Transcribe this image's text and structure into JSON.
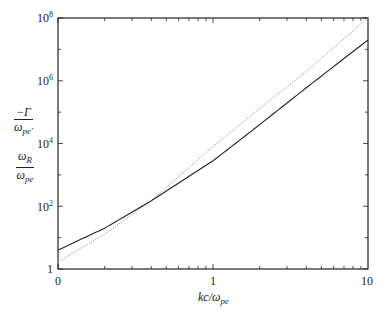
{
  "chart_data": {
    "type": "line",
    "title": "",
    "xlabel": "kc/ω_pe",
    "ylabel": [
      "-Γ/ω_pe'",
      "ω_R/ω_pe"
    ],
    "xscale": "log",
    "yscale": "log",
    "xlim": [
      0.1,
      10
    ],
    "ylim": [
      1,
      100000000
    ],
    "x_tick_labels": [
      "0",
      "1",
      "10"
    ],
    "y_tick_labels": [
      "1",
      "10^2",
      "10^4",
      "10^6",
      "10^8"
    ],
    "grid": false,
    "legend": "none",
    "series": [
      {
        "name": "-Γ/ω_pe' (solid)",
        "style": "solid",
        "x": [
          0.1,
          0.2,
          0.4,
          1,
          2,
          4,
          10
        ],
        "y": [
          4,
          20,
          150,
          2800,
          40000,
          600000,
          20000000
        ]
      },
      {
        "name": "ω_R/ω_pe (dotted)",
        "style": "dotted",
        "x": [
          0.1,
          0.2,
          0.4,
          1,
          2,
          4,
          10
        ],
        "y": [
          1.7,
          13,
          150,
          8000,
          130000,
          2000000,
          100000000
        ]
      }
    ]
  },
  "labels": {
    "y_ticks": {
      "t0": "1",
      "t2": "10",
      "t4": "10",
      "t6": "10",
      "t8": "10",
      "e2": "2",
      "e4": "4",
      "e6": "6",
      "e8": "8"
    },
    "x_ticks": {
      "t0": "0",
      "t1": "1",
      "t10": "10"
    },
    "xlabel_main": "kc/ω",
    "xlabel_sub": "pe",
    "gamma_num": "−Γ",
    "gamma_den": "ω",
    "gamma_den_sub": "pe'",
    "omega_num": "ω",
    "omega_num_sub": "R",
    "omega_den": "ω",
    "omega_den_sub": "pe"
  }
}
